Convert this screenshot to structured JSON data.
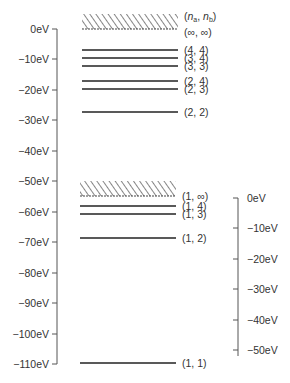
{
  "left_axis": {
    "ticks": [
      {
        "label": "0eV",
        "y": 29
      },
      {
        "label": "−10eV",
        "y": 59
      },
      {
        "label": "−20eV",
        "y": 90
      },
      {
        "label": "−30eV",
        "y": 120
      },
      {
        "label": "−40eV",
        "y": 151
      },
      {
        "label": "−50eV",
        "y": 181
      },
      {
        "label": "−60eV",
        "y": 212
      },
      {
        "label": "−70eV",
        "y": 242
      },
      {
        "label": "−80eV",
        "y": 273
      },
      {
        "label": "−90eV",
        "y": 303
      },
      {
        "label": "−100eV",
        "y": 334
      },
      {
        "label": "−110eV",
        "y": 364
      }
    ]
  },
  "right_axis": {
    "ticks": [
      {
        "label": "0eV",
        "y": 198
      },
      {
        "label": "−10eV",
        "y": 228
      },
      {
        "label": "−20eV",
        "y": 259
      },
      {
        "label": "−30eV",
        "y": 289
      },
      {
        "label": "−40eV",
        "y": 320
      },
      {
        "label": "−50eV",
        "y": 350
      }
    ]
  },
  "upper_continuum": {
    "label_top": "(n_a, n_b)",
    "label_bottom": "(∞, ∞)"
  },
  "lower_continuum": {
    "label": "(1, ∞)"
  },
  "levels": [
    {
      "label": "(4, 4)",
      "y": 50
    },
    {
      "label": "(3, 4)",
      "y": 58
    },
    {
      "label": "(3, 3)",
      "y": 66
    },
    {
      "label": "(2, 4)",
      "y": 81
    },
    {
      "label": "(2, 3)",
      "y": 89
    },
    {
      "label": "(2, 2)",
      "y": 112
    },
    {
      "label": "(1, 4)",
      "y": 206
    },
    {
      "label": "(1, 3)",
      "y": 214
    },
    {
      "label": "(1, 2)",
      "y": 238
    },
    {
      "label": "(1, 1)",
      "y": 363
    }
  ]
}
